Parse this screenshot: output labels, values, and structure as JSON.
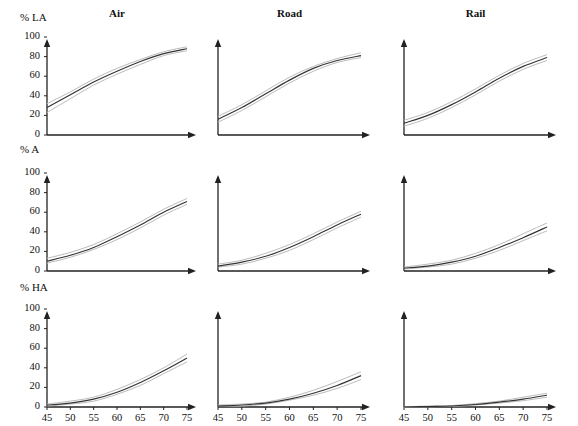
{
  "figure": {
    "width": 578,
    "height": 426,
    "background": "#ffffff",
    "line_color": "#333333",
    "band_color": "#bbbbbb",
    "axis_color": "#222222"
  },
  "columns": [
    {
      "key": "air",
      "title": "Air"
    },
    {
      "key": "road",
      "title": "Road"
    },
    {
      "key": "rail",
      "title": "Rail"
    }
  ],
  "rows": [
    {
      "key": "la",
      "ylabel": "% LA"
    },
    {
      "key": "a",
      "ylabel": "% A"
    },
    {
      "key": "ha",
      "ylabel": "% HA"
    }
  ],
  "axes": {
    "xlabel": "DNL",
    "xticks": [
      "45",
      "50",
      "55",
      "60",
      "65",
      "70",
      "75"
    ],
    "yticks": [
      "0",
      "20",
      "40",
      "60",
      "80",
      "100"
    ],
    "xlim": [
      45,
      75
    ],
    "ylim": [
      0,
      100
    ],
    "grid": false,
    "legend": "none"
  },
  "chart_data": {
    "type": "line",
    "title": "",
    "subtitle": "",
    "xlabel": "DNL",
    "ylabel": "% LA / % A / % HA",
    "xlim": [
      45,
      75
    ],
    "ylim": [
      0,
      100
    ],
    "xticks": [
      45,
      50,
      55,
      60,
      65,
      70,
      75
    ],
    "yticks": [
      0,
      20,
      40,
      60,
      80,
      100
    ],
    "grid": false,
    "legend": "none",
    "x": [
      45,
      50,
      55,
      60,
      65,
      70,
      75
    ],
    "panels": [
      {
        "row": "% LA",
        "column": "Air",
        "series": [
          {
            "name": "fit",
            "values": [
              28,
              41,
              54,
              65,
              75,
              83,
              88
            ]
          },
          {
            "name": "upper",
            "values": [
              32,
              44,
              57,
              68,
              77,
              85,
              90
            ]
          },
          {
            "name": "lower",
            "values": [
              23,
              37,
              51,
              62,
              72,
              81,
              86
            ]
          }
        ]
      },
      {
        "row": "% LA",
        "column": "Road",
        "series": [
          {
            "name": "fit",
            "values": [
              16,
              28,
              42,
              56,
              68,
              76,
              81
            ]
          },
          {
            "name": "upper",
            "values": [
              19,
              31,
              45,
              59,
              70,
              78,
              84
            ]
          },
          {
            "name": "lower",
            "values": [
              13,
              25,
              39,
              53,
              65,
              74,
              79
            ]
          }
        ]
      },
      {
        "row": "% LA",
        "column": "Rail",
        "series": [
          {
            "name": "fit",
            "values": [
              12,
              20,
              31,
              44,
              58,
              70,
              79
            ]
          },
          {
            "name": "upper",
            "values": [
              15,
              23,
              34,
              47,
              61,
              73,
              82
            ]
          },
          {
            "name": "lower",
            "values": [
              9,
              17,
              28,
              41,
              55,
              67,
              76
            ]
          }
        ]
      },
      {
        "row": "% A",
        "column": "Air",
        "series": [
          {
            "name": "fit",
            "values": [
              10,
              16,
              24,
              35,
              47,
              60,
              71
            ]
          },
          {
            "name": "upper",
            "values": [
              13,
              19,
              27,
              38,
              50,
              63,
              74
            ]
          },
          {
            "name": "lower",
            "values": [
              8,
              14,
              22,
              32,
              44,
              57,
              68
            ]
          }
        ]
      },
      {
        "row": "% A",
        "column": "Road",
        "series": [
          {
            "name": "fit",
            "values": [
              5,
              9,
              15,
              24,
              35,
              47,
              58
            ]
          },
          {
            "name": "upper",
            "values": [
              7,
              11,
              18,
              27,
              38,
              50,
              61
            ]
          },
          {
            "name": "lower",
            "values": [
              4,
              7,
              13,
              21,
              32,
              44,
              55
            ]
          }
        ]
      },
      {
        "row": "% A",
        "column": "Rail",
        "series": [
          {
            "name": "fit",
            "values": [
              3,
              5,
              9,
              15,
              24,
              34,
              45
            ]
          },
          {
            "name": "upper",
            "values": [
              4,
              7,
              11,
              18,
              27,
              38,
              49
            ]
          },
          {
            "name": "lower",
            "values": [
              2,
              4,
              7,
              13,
              21,
              31,
              41
            ]
          }
        ]
      },
      {
        "row": "% HA",
        "column": "Air",
        "series": [
          {
            "name": "fit",
            "values": [
              2,
              4,
              8,
              15,
              25,
              37,
              50
            ]
          },
          {
            "name": "upper",
            "values": [
              3,
              6,
              10,
              18,
              28,
              40,
              54
            ]
          },
          {
            "name": "lower",
            "values": [
              1,
              3,
              6,
              13,
              22,
              34,
              46
            ]
          }
        ]
      },
      {
        "row": "% HA",
        "column": "Road",
        "series": [
          {
            "name": "fit",
            "values": [
              1,
              2,
              4,
              8,
              14,
              22,
              32
            ]
          },
          {
            "name": "upper",
            "values": [
              2,
              3,
              5,
              10,
              17,
              26,
              36
            ]
          },
          {
            "name": "lower",
            "values": [
              1,
              1,
              3,
              7,
              12,
              19,
              28
            ]
          }
        ]
      },
      {
        "row": "% HA",
        "column": "Rail",
        "series": [
          {
            "name": "fit",
            "values": [
              0,
              0.5,
              1,
              2.5,
              5,
              8,
              12
            ]
          },
          {
            "name": "upper",
            "values": [
              0,
              1,
              1.5,
              3.5,
              6,
              10,
              14
            ]
          },
          {
            "name": "lower",
            "values": [
              0,
              0.3,
              0.7,
              2,
              4,
              6.5,
              10
            ]
          }
        ]
      }
    ]
  }
}
